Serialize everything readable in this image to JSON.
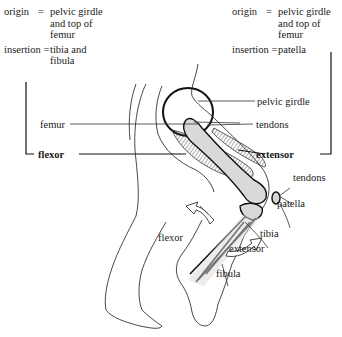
{
  "flexor_box": {
    "origin_label": "origin",
    "origin_eq": "=",
    "origin_value": [
      "pelvic girdle",
      "and top of",
      "femur"
    ],
    "insertion_label": "insertion",
    "insertion_eq": "=",
    "insertion_value": [
      "tibia and",
      "fibula"
    ]
  },
  "extensor_box": {
    "origin_label": "origin",
    "origin_eq": "=",
    "origin_value": [
      "pelvic girdle",
      "and top of",
      "femur"
    ],
    "insertion_label": "insertion",
    "insertion_eq": "=",
    "insertion_value": [
      "patella"
    ]
  },
  "labels": {
    "pelvic_girdle": "pelvic girdle",
    "tendons_top": "tendons",
    "femur": "femur",
    "flexor_main": "flexor",
    "extensor_main": "extensor",
    "tendons_knee": "tendons",
    "patella": "patella",
    "flexor_arrow": "flexor",
    "tibia": "tibia",
    "extensor_arrow": "extensor",
    "fibula": "fibula"
  },
  "colors": {
    "bone_fill": "#d9d9d9",
    "line": "#1a1a1a",
    "outline": "#333333"
  }
}
